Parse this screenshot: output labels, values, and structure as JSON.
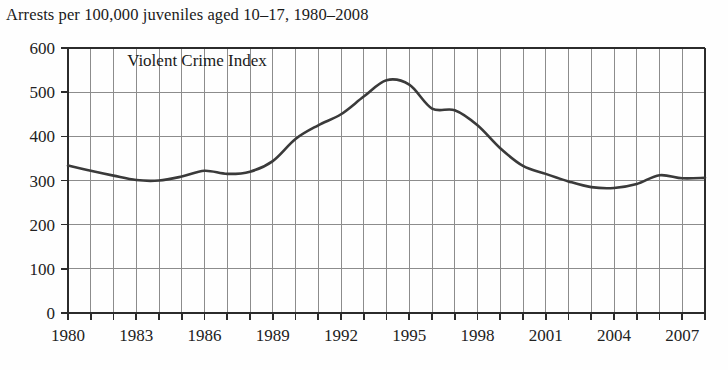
{
  "chart_data": {
    "type": "line",
    "title": "Arrests per 100,000 juveniles aged 10–17, 1980–2008",
    "xlabel": "",
    "ylabel": "",
    "xlim": [
      1980,
      2008
    ],
    "ylim": [
      0,
      600
    ],
    "grid": true,
    "legend_position": "inside-plot",
    "annotations": [
      {
        "text": "Violent Crime Index",
        "x": 1982.6,
        "y": 560
      }
    ],
    "yticks": [
      0,
      100,
      200,
      300,
      400,
      500,
      600
    ],
    "ytick_labels": [
      "0",
      "100",
      "200",
      "300",
      "400",
      "500",
      "600"
    ],
    "xticks": [
      1980,
      1981,
      1982,
      1983,
      1984,
      1985,
      1986,
      1987,
      1988,
      1989,
      1990,
      1991,
      1992,
      1993,
      1994,
      1995,
      1996,
      1997,
      1998,
      1999,
      2000,
      2001,
      2002,
      2003,
      2004,
      2005,
      2006,
      2007,
      2008
    ],
    "xtick_labels": [
      "1980",
      "1983",
      "1986",
      "1989",
      "1992",
      "1995",
      "1998",
      "2001",
      "2004",
      "2007"
    ],
    "labeled_xticks": [
      1980,
      1983,
      1986,
      1989,
      1992,
      1995,
      1998,
      2001,
      2004,
      2007
    ],
    "series": [
      {
        "name": "Violent Crime Index",
        "color": "#3a3a3a",
        "x": [
          1980,
          1981,
          1982,
          1983,
          1984,
          1985,
          1986,
          1987,
          1988,
          1989,
          1990,
          1991,
          1992,
          1993,
          1994,
          1995,
          1996,
          1997,
          1998,
          1999,
          2000,
          2001,
          2002,
          2003,
          2004,
          2005,
          2006,
          2007,
          2008
        ],
        "values": [
          334,
          322,
          311,
          301,
          300,
          309,
          322,
          315,
          320,
          344,
          394,
          425,
          450,
          490,
          527,
          517,
          463,
          459,
          425,
          373,
          333,
          315,
          298,
          285,
          283,
          292,
          312,
          305,
          306
        ]
      }
    ]
  },
  "axis_colors": {
    "grid": "#8c8c8c",
    "frame": "#2b2b2b",
    "line": "#3a3a3a",
    "text": "#222222"
  }
}
